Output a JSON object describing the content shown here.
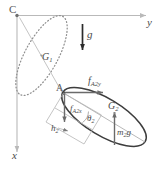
{
  "figure": {
    "name": "double-pendulum-free-body-diagram",
    "colors": {
      "axis": "#b9b9b9",
      "body1_outline": "#8f8f8f",
      "body2_outline": "#3d3d3d",
      "force_arrow": "#6a6a6a",
      "gravity_arrow": "#2b2b2b",
      "label": "#4a4a4a",
      "background": "#ffffff"
    },
    "axes": {
      "origin_label": "C",
      "horizontal_label": "y",
      "vertical_label": "x"
    },
    "labels": {
      "point_c": "C",
      "point_a": "A",
      "axis_y": "y",
      "axis_x": "x",
      "gravity": "g",
      "centroid_1": "G",
      "centroid_1_sub": "1",
      "centroid_2": "G",
      "centroid_2_sub": "2",
      "force_y": "f",
      "force_y_sub": "A2y",
      "force_x": "f",
      "force_x_sub": "A2x",
      "angle_2": "θ",
      "angle_2_sub": "2",
      "weight_2": "m",
      "weight_2_sub": "2",
      "weight_2_tail": "g",
      "height_2": "h",
      "height_2_sub": "2"
    }
  }
}
